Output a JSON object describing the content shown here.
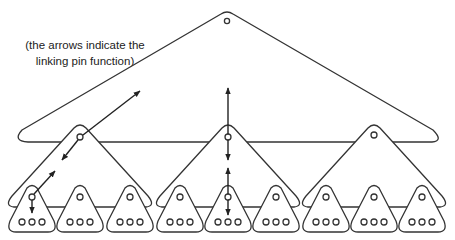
{
  "caption": {
    "line1": "(the arrows indicate the",
    "line2": "linking pin function)"
  },
  "diagram": {
    "type": "linking-pin-organization",
    "levels": [
      {
        "name": "top",
        "count": 1
      },
      {
        "name": "middle",
        "count": 3
      },
      {
        "name": "bottom",
        "count": 9
      }
    ],
    "stroke_color": "#333333",
    "background": "#ffffff"
  }
}
